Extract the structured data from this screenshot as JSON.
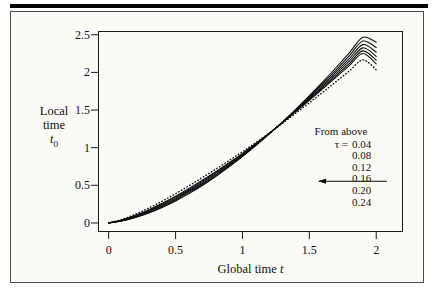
{
  "figure": {
    "background_color": "#fbfaf7",
    "ink_color": "#111111"
  },
  "axes": {
    "x": {
      "label_prefix": "Global time",
      "label_var": "t",
      "ticks": [
        "0",
        "0.5",
        "1",
        "1.5",
        "2"
      ],
      "tick_values": [
        0,
        0.5,
        1,
        1.5,
        2
      ],
      "range": [
        -0.08,
        2.2
      ]
    },
    "y": {
      "label_line1": "Local",
      "label_line2": "time",
      "label_var": "t",
      "label_sub": "0",
      "ticks": [
        "0",
        "0.5",
        "1",
        "1.5",
        "2",
        "2.5"
      ],
      "tick_values": [
        0,
        0.5,
        1,
        1.5,
        2,
        2.5
      ],
      "range": [
        -0.12,
        2.55
      ]
    }
  },
  "legend": {
    "title": "From above",
    "symbol": "τ  =",
    "values": [
      "0.04",
      "0.08",
      "0.12",
      "0.16",
      "0.20",
      "0.24"
    ]
  },
  "annotation": {
    "arrow_direction": "left",
    "arrow_x_start": 2.08,
    "arrow_x_end": 1.565,
    "arrow_y": 0.555
  },
  "chart_data": {
    "type": "line",
    "title": "",
    "xlabel": "Global time t",
    "ylabel": "Local time t_0",
    "xlim": [
      -0.08,
      2.2
    ],
    "ylim": [
      -0.12,
      2.55
    ],
    "grid": false,
    "legend_position": "inside-right",
    "x": [
      0,
      0.1,
      0.2,
      0.3,
      0.4,
      0.5,
      0.6,
      0.7,
      0.8,
      0.9,
      1.0,
      1.1,
      1.2,
      1.25,
      1.3,
      1.4,
      1.5,
      1.6,
      1.7,
      1.8,
      1.9,
      2.0
    ],
    "series": [
      {
        "name": "tau = 0.04",
        "style": "solid",
        "values": [
          0,
          0.027,
          0.072,
          0.132,
          0.206,
          0.292,
          0.39,
          0.498,
          0.617,
          0.745,
          0.882,
          1.028,
          1.182,
          1.262,
          1.344,
          1.513,
          1.69,
          1.874,
          2.065,
          2.263,
          2.468,
          2.4
        ]
      },
      {
        "name": "tau = 0.08",
        "style": "solid",
        "values": [
          0,
          0.029,
          0.077,
          0.14,
          0.216,
          0.304,
          0.403,
          0.511,
          0.629,
          0.756,
          0.891,
          1.034,
          1.184,
          1.262,
          1.342,
          1.506,
          1.676,
          1.853,
          2.035,
          2.223,
          2.416,
          2.33
        ]
      },
      {
        "name": "tau = 0.12",
        "style": "solid",
        "values": [
          0,
          0.031,
          0.082,
          0.148,
          0.227,
          0.317,
          0.417,
          0.525,
          0.642,
          0.767,
          0.9,
          1.04,
          1.186,
          1.262,
          1.34,
          1.499,
          1.663,
          1.833,
          2.007,
          2.186,
          2.369,
          2.268
        ]
      },
      {
        "name": "tau = 0.16",
        "style": "solid",
        "values": [
          0,
          0.034,
          0.088,
          0.157,
          0.238,
          0.33,
          0.431,
          0.539,
          0.655,
          0.778,
          0.908,
          1.045,
          1.188,
          1.262,
          1.338,
          1.492,
          1.651,
          1.814,
          1.982,
          2.152,
          2.326,
          2.212
        ]
      },
      {
        "name": "tau = 0.20",
        "style": "solid",
        "values": [
          0,
          0.037,
          0.094,
          0.166,
          0.249,
          0.343,
          0.445,
          0.553,
          0.668,
          0.789,
          0.917,
          1.051,
          1.19,
          1.262,
          1.336,
          1.486,
          1.64,
          1.797,
          1.958,
          2.121,
          2.286,
          2.161
        ]
      },
      {
        "name": "tau = 0.24",
        "style": "solid",
        "values": [
          0,
          0.04,
          0.101,
          0.176,
          0.261,
          0.356,
          0.459,
          0.567,
          0.68,
          0.8,
          0.925,
          1.056,
          1.192,
          1.262,
          1.334,
          1.48,
          1.629,
          1.781,
          1.936,
          2.093,
          2.25,
          2.113
        ]
      },
      {
        "name": "limit",
        "style": "dotted",
        "values": [
          0,
          0.048,
          0.117,
          0.199,
          0.29,
          0.389,
          0.494,
          0.603,
          0.714,
          0.829,
          0.947,
          1.068,
          1.194,
          1.259,
          1.325,
          1.46,
          1.597,
          1.736,
          1.878,
          2.021,
          2.166,
          2.035
        ]
      }
    ]
  }
}
